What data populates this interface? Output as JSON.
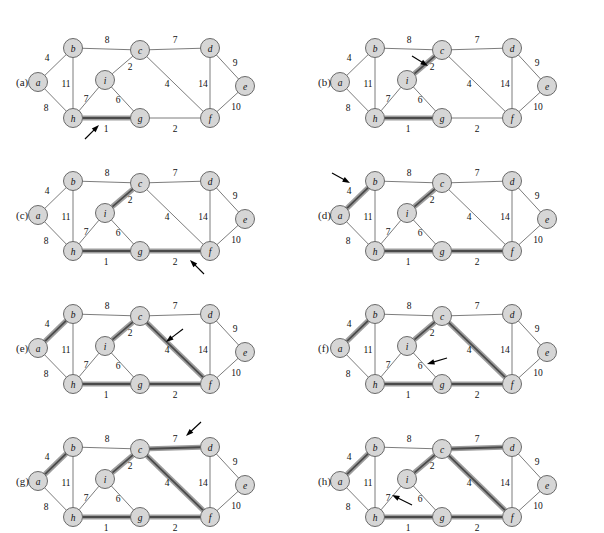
{
  "figure": {
    "caption_label_prefix": "(",
    "caption_label_suffix": ")"
  },
  "graph": {
    "nodes": [
      {
        "id": "a",
        "label": "a",
        "x": 38,
        "y": 74
      },
      {
        "id": "b",
        "label": "b",
        "x": 73,
        "y": 40
      },
      {
        "id": "c",
        "label": "c",
        "x": 140,
        "y": 42
      },
      {
        "id": "d",
        "label": "d",
        "x": 210,
        "y": 40
      },
      {
        "id": "e",
        "label": "e",
        "x": 245,
        "y": 78
      },
      {
        "id": "f",
        "label": "f",
        "x": 210,
        "y": 110
      },
      {
        "id": "g",
        "label": "g",
        "x": 140,
        "y": 110
      },
      {
        "id": "h",
        "label": "h",
        "x": 73,
        "y": 110
      },
      {
        "id": "i",
        "label": "i",
        "x": 105,
        "y": 72
      }
    ],
    "edges": [
      {
        "id": "ab",
        "from": "a",
        "to": "b",
        "weight": 4,
        "lx": 47,
        "ly": 50
      },
      {
        "id": "ah",
        "from": "a",
        "to": "h",
        "weight": 8,
        "lx": 46,
        "ly": 100
      },
      {
        "id": "bc",
        "from": "b",
        "to": "c",
        "weight": 8,
        "lx": 107,
        "ly": 32
      },
      {
        "id": "bh",
        "from": "b",
        "to": "h",
        "weight": 11,
        "lx": 66,
        "ly": 76
      },
      {
        "id": "cd",
        "from": "c",
        "to": "d",
        "weight": 7,
        "lx": 175,
        "ly": 32
      },
      {
        "id": "ci",
        "from": "c",
        "to": "i",
        "weight": 2,
        "lx": 130,
        "ly": 59
      },
      {
        "id": "cf",
        "from": "c",
        "to": "f",
        "weight": 4,
        "lx": 167,
        "ly": 76
      },
      {
        "id": "de",
        "from": "d",
        "to": "e",
        "weight": 9,
        "lx": 235,
        "ly": 55
      },
      {
        "id": "df",
        "from": "d",
        "to": "f",
        "weight": 14,
        "lx": 203,
        "ly": 76
      },
      {
        "id": "ef",
        "from": "e",
        "to": "f",
        "weight": 10,
        "lx": 236,
        "ly": 99
      },
      {
        "id": "fg",
        "from": "f",
        "to": "g",
        "weight": 2,
        "lx": 175,
        "ly": 121
      },
      {
        "id": "gh",
        "from": "g",
        "to": "h",
        "weight": 1,
        "lx": 106,
        "ly": 121
      },
      {
        "id": "gi",
        "from": "g",
        "to": "i",
        "weight": 6,
        "lx": 118,
        "ly": 92
      },
      {
        "id": "hi",
        "from": "h",
        "to": "i",
        "weight": 7,
        "lx": 86,
        "ly": 91
      }
    ],
    "node_radius": 9.5
  },
  "panels": [
    {
      "id": "a",
      "label": "(a)",
      "col": 0,
      "row": 0,
      "highlighted_edges": [
        "gh"
      ],
      "arrow": {
        "tip_x": 99,
        "tip_y": 117,
        "tail_x": 85,
        "tail_y": 131
      },
      "arrow_target_edge": "gh",
      "arrow_target_weight": 1
    },
    {
      "id": "b",
      "label": "(b)",
      "col": 1,
      "row": 0,
      "highlighted_edges": [
        "gh",
        "ci"
      ],
      "arrow": {
        "tip_x": 126,
        "tip_y": 58,
        "tail_x": 110,
        "tail_y": 48
      },
      "arrow_target_edge": "ci",
      "arrow_target_weight": 2
    },
    {
      "id": "c",
      "label": "(c)",
      "col": 0,
      "row": 1,
      "highlighted_edges": [
        "gh",
        "ci",
        "fg"
      ],
      "arrow": {
        "tip_x": 190,
        "tip_y": 119,
        "tail_x": 204,
        "tail_y": 133
      },
      "arrow_target_edge": "fg",
      "arrow_target_weight": 2
    },
    {
      "id": "d",
      "label": "(d)",
      "col": 1,
      "row": 1,
      "highlighted_edges": [
        "gh",
        "ci",
        "fg",
        "ab"
      ],
      "arrow": {
        "tip_x": 48,
        "tip_y": 42,
        "tail_x": 30,
        "tail_y": 32
      },
      "arrow_target_edge": "ab",
      "arrow_target_weight": 4
    },
    {
      "id": "e",
      "label": "(e)",
      "col": 0,
      "row": 2,
      "highlighted_edges": [
        "gh",
        "ci",
        "fg",
        "ab",
        "cf"
      ],
      "arrow": {
        "tip_x": 166,
        "tip_y": 68,
        "tail_x": 183,
        "tail_y": 55
      },
      "arrow_target_edge": "cf",
      "arrow_target_weight": 4
    },
    {
      "id": "f",
      "label": "(f)",
      "col": 1,
      "row": 2,
      "highlighted_edges": [
        "gh",
        "ci",
        "fg",
        "ab",
        "cf"
      ],
      "arrow": {
        "tip_x": 125,
        "tip_y": 90,
        "tail_x": 145,
        "tail_y": 84
      },
      "arrow_target_edge": "gi",
      "arrow_target_weight": 6
    },
    {
      "id": "g",
      "label": "(g)",
      "col": 0,
      "row": 3,
      "highlighted_edges": [
        "gh",
        "ci",
        "fg",
        "ab",
        "cf",
        "cd"
      ],
      "arrow": {
        "tip_x": 186,
        "tip_y": 29,
        "tail_x": 201,
        "tail_y": 15
      },
      "arrow_target_edge": "cd",
      "arrow_target_weight": 7
    },
    {
      "id": "h",
      "label": "(h)",
      "col": 1,
      "row": 3,
      "highlighted_edges": [
        "gh",
        "ci",
        "fg",
        "ab",
        "cf",
        "cd"
      ],
      "arrow": {
        "tip_x": 90,
        "tip_y": 88,
        "tail_x": 110,
        "tail_y": 98
      },
      "arrow_target_edge": "hi",
      "arrow_target_weight": 7
    }
  ],
  "colors": {
    "node_fill": "#d6d6d6",
    "node_stroke": "#5a5a5a",
    "edge_stroke": "#6d6d6d",
    "highlight_band": "#9e9e9e",
    "highlight_core": "#4a4a4a",
    "text": "#111111",
    "background": "#ffffff"
  },
  "layout": {
    "panel_width": 302,
    "panel_height": 133,
    "origin_x": 26,
    "origin_y": 8,
    "label_offset_x": -4,
    "label_offset_y": 74
  }
}
